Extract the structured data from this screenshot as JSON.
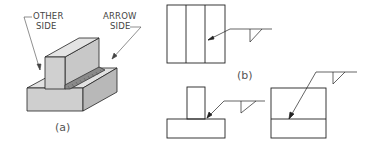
{
  "figure": {
    "part_a": {
      "other_side_label_1": "OTHER",
      "other_side_label_2": "SIDE",
      "arrow_side_label_1": "ARROW",
      "arrow_side_label_2": "SIDE",
      "caption": "(a)"
    },
    "part_b": {
      "caption": "(b)"
    },
    "colors": {
      "line": "#222222",
      "face_front": "#cfcfcf",
      "face_top": "#e4e4e4",
      "face_side": "#b5b5b5",
      "weld": "#777777"
    }
  }
}
